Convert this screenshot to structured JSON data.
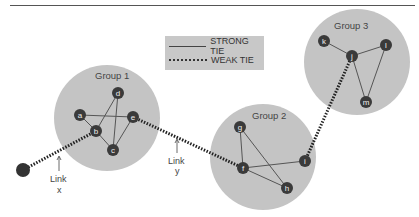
{
  "legend": {
    "strong_label": "STRONG TIE",
    "weak_label": "WEAK TIE"
  },
  "groups": [
    {
      "name": "Group 1",
      "nodes": [
        "a",
        "b",
        "c",
        "d",
        "e"
      ]
    },
    {
      "name": "Group 2",
      "nodes": [
        "f",
        "g",
        "h",
        "i"
      ]
    },
    {
      "name": "Group 3",
      "nodes": [
        "j",
        "k",
        "l",
        "m"
      ]
    }
  ],
  "nodes": {
    "a": "a",
    "b": "b",
    "c": "c",
    "d": "d",
    "e": "e",
    "f": "f",
    "g": "g",
    "h": "h",
    "i": "i",
    "j": "j",
    "k": "k",
    "l": "l",
    "m": "m"
  },
  "strong_ties": [
    [
      "a",
      "b"
    ],
    [
      "a",
      "e"
    ],
    [
      "b",
      "c"
    ],
    [
      "b",
      "d"
    ],
    [
      "d",
      "c"
    ],
    [
      "e",
      "c"
    ],
    [
      "g",
      "f"
    ],
    [
      "g",
      "h"
    ],
    [
      "f",
      "h"
    ],
    [
      "f",
      "i"
    ],
    [
      "k",
      "j"
    ],
    [
      "j",
      "l"
    ],
    [
      "j",
      "m"
    ],
    [
      "l",
      "m"
    ]
  ],
  "weak_ties": [
    [
      "outside",
      "b"
    ],
    [
      "e",
      "f"
    ],
    [
      "i",
      "j"
    ]
  ],
  "annotations": {
    "link_x_line1": "Link",
    "link_x_line2": "x",
    "link_y_line1": "Link",
    "link_y_line2": "y"
  },
  "colors": {
    "group_fill": "#c4c4c4",
    "node_fill": "#3a3a3a",
    "outside_node_fill": "#333333",
    "legend_bg": "#c8c8c8"
  }
}
